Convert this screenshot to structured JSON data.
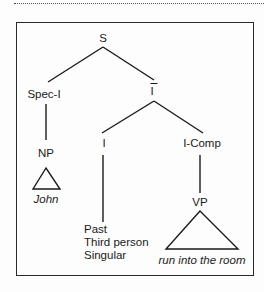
{
  "diagram": {
    "type": "syntax-tree",
    "nodes": {
      "root": {
        "label": "S"
      },
      "spec_i": {
        "label": "Spec-I"
      },
      "i_bar": {
        "label": "I",
        "decoration": "overbar"
      },
      "np": {
        "label": "NP"
      },
      "john": {
        "label": "John"
      },
      "i": {
        "label": "I"
      },
      "i_comp": {
        "label": "I-Comp"
      },
      "features": {
        "lines": [
          "Past",
          "Third person",
          "Singular"
        ]
      },
      "vp": {
        "label": "VP"
      },
      "vp_yield": {
        "label": "run into the room"
      }
    },
    "edges": [
      [
        "S",
        "Spec-I"
      ],
      [
        "S",
        "I-bar"
      ],
      [
        "Spec-I",
        "NP"
      ],
      [
        "NP",
        "John (triangle)"
      ],
      [
        "I-bar",
        "I"
      ],
      [
        "I-bar",
        "I-Comp"
      ],
      [
        "I",
        "Past / Third person / Singular"
      ],
      [
        "I-Comp",
        "VP"
      ],
      [
        "VP",
        "run into the room (triangle)"
      ]
    ]
  }
}
